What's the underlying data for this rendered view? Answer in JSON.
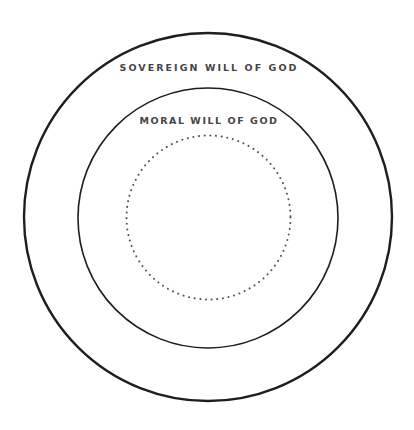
{
  "diagram": {
    "type": "nested-circles",
    "colors": {
      "background": "#ffffff",
      "stroke": "#1e1e1e",
      "dots": "#555555",
      "label": "#454545"
    },
    "circles": [
      {
        "id": "outer",
        "label": "SOVEREIGN WILL OF GOD",
        "style": "solid",
        "cx": 208,
        "cy": 217,
        "r": 184
      },
      {
        "id": "middle",
        "label": "MORAL WILL OF GOD",
        "style": "solid",
        "cx": 208,
        "cy": 218,
        "r": 130
      },
      {
        "id": "inner",
        "label": "",
        "style": "dotted",
        "cx": 208.5,
        "cy": 217.5,
        "r": 82
      }
    ]
  }
}
